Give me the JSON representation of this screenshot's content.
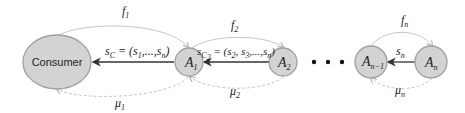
{
  "diagram": {
    "nodes": {
      "consumer": "Consumer",
      "a1": {
        "base": "A",
        "sub": "1"
      },
      "a2": {
        "base": "A",
        "sub": "2"
      },
      "an1": {
        "base": "A",
        "sub": "n−1"
      },
      "an": {
        "base": "A",
        "sub": "n"
      }
    },
    "ellipsis": "• • •",
    "edges": {
      "f1": {
        "base": "f",
        "sub": "1"
      },
      "f2": {
        "base": "f",
        "sub": "2"
      },
      "fn": {
        "base": "f",
        "sub": "n"
      },
      "mu1": {
        "base": "μ",
        "sub": "1"
      },
      "mu2": {
        "base": "μ",
        "sub": "2"
      },
      "mun": {
        "base": "μ",
        "sub": "n"
      },
      "sc": {
        "base": "s",
        "sub": "C",
        "rest": " = (s",
        "rest_sub1": "1",
        "rest_mid": ",...,s",
        "rest_sub2": "n",
        "rest_end": ")"
      },
      "sc2": {
        "base": "s",
        "sub": "C",
        "sub2": "2",
        "rest": " = (s",
        "rest_sub1": "2",
        "rest_mid1": ", s",
        "rest_sub2": "3",
        "rest_mid2": ",...,s",
        "rest_sub3": "n",
        "rest_end": ")"
      },
      "sn": {
        "base": "s",
        "sub": "n"
      }
    },
    "colors": {
      "node_fill": "#d3d3d3",
      "node_stroke": "#a0a0a0",
      "feedback_arc": "#c8c8c8",
      "data_arrow": "#333333"
    }
  }
}
